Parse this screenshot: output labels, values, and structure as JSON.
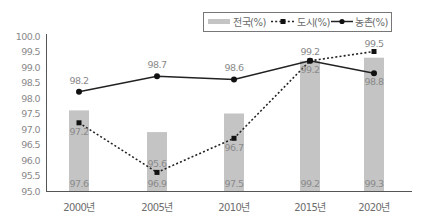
{
  "chart_data": {
    "type": "bar+line",
    "title": "",
    "categories": [
      "2000년",
      "2005년",
      "2010년",
      "2015년",
      "2020년"
    ],
    "series": [
      {
        "name": "전국(%)",
        "type": "bar",
        "color": "#c4c4c4",
        "values": [
          97.6,
          96.9,
          97.5,
          99.2,
          99.3
        ]
      },
      {
        "name": "도시(%)",
        "type": "line",
        "style": "dotted",
        "marker": "square",
        "color": "#222222",
        "values": [
          97.2,
          95.6,
          96.7,
          99.2,
          99.5
        ]
      },
      {
        "name": "농촌(%)",
        "type": "line",
        "style": "solid",
        "marker": "circle",
        "color": "#222222",
        "values": [
          98.2,
          98.7,
          98.6,
          99.2,
          98.8
        ]
      }
    ],
    "xlabel": "",
    "ylabel": "",
    "ylim": [
      95.0,
      100.0
    ],
    "yticks": [
      "100.0",
      "99.5",
      "99.0",
      "98.5",
      "98.0",
      "97.5",
      "97.0",
      "96.5",
      "96.0",
      "95.5",
      "95.0"
    ],
    "grid": false,
    "legend_position": "top-right"
  },
  "legend": {
    "national": "전국(%)",
    "urban": "도시(%)",
    "rural": "농촌(%)"
  }
}
